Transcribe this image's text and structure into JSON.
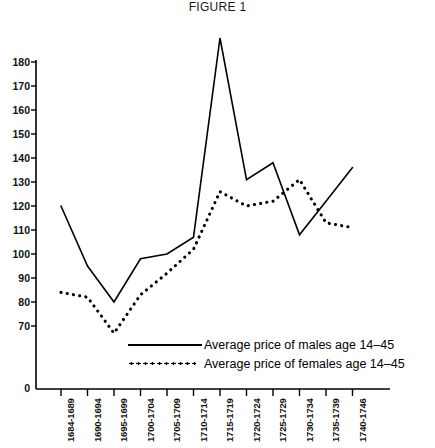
{
  "title": "FIGURE 1",
  "legend": {
    "items": [
      {
        "label": "Average price of males age 14–45",
        "style": "solid"
      },
      {
        "label": "Average price of females age 14–45",
        "style": "dotted"
      }
    ]
  },
  "axes": {
    "y_ticks": [
      "180",
      "170",
      "160",
      "150",
      "140",
      "130",
      "120",
      "110",
      "100",
      "90",
      "80",
      "70",
      "0"
    ],
    "x_ticks": [
      "1684-1689",
      "1690-1694",
      "1695-1699",
      "1700-1704",
      "1705-1709",
      "1710-1714",
      "1715-1719",
      "1720-1724",
      "1725-1729",
      "1730-1734",
      "1735-1739",
      "1740-1746"
    ]
  },
  "chart_data": {
    "type": "line",
    "title": "FIGURE 1",
    "xlabel": "",
    "ylabel": "",
    "ylim": [
      70,
      180
    ],
    "y_break_below": 70,
    "yticks": [
      70,
      80,
      90,
      100,
      110,
      120,
      130,
      140,
      150,
      160,
      170,
      180
    ],
    "zero_tick": 0,
    "grid": false,
    "legend_position": "inside-bottom-right",
    "categories": [
      "1684-1689",
      "1690-1694",
      "1695-1699",
      "1700-1704",
      "1705-1709",
      "1710-1714",
      "1715-1719",
      "1720-1724",
      "1725-1729",
      "1730-1734",
      "1735-1739",
      "1740-1746"
    ],
    "series": [
      {
        "name": "Average price of males age 14–45",
        "style": "solid",
        "color": "#000000",
        "values": [
          120,
          95,
          80,
          98,
          100,
          107,
          190,
          131,
          138,
          108,
          122,
          136
        ]
      },
      {
        "name": "Average price of females age 14–45",
        "style": "dotted",
        "color": "#000000",
        "values": [
          84,
          82,
          67,
          83,
          92,
          102,
          126,
          120,
          122,
          131,
          113,
          111
        ]
      }
    ]
  },
  "colors": {
    "ink": "#000000",
    "background": "#ffffff"
  }
}
